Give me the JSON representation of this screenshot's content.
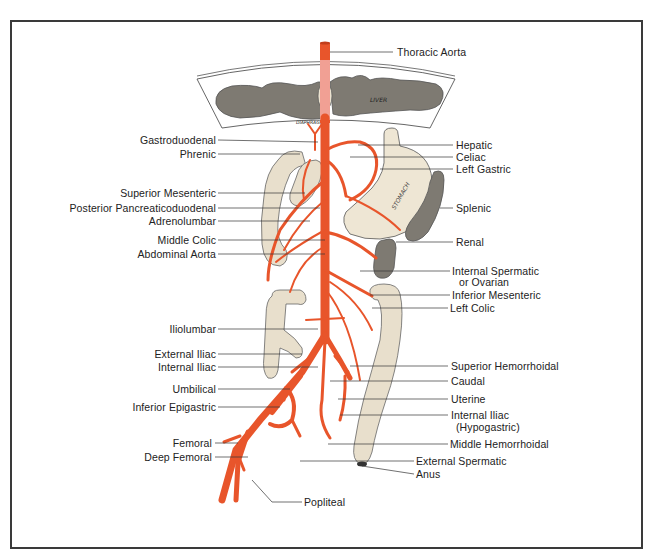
{
  "figure": {
    "colors": {
      "artery": "#e8552b",
      "artery_dark": "#c23e1c",
      "thoracic_aorta_behind": "#f2a8a0",
      "organ_gray": "#7e7a72",
      "intestine": "#e8dfcc",
      "stomach": "#eee6d4",
      "frame": "#3a3a3a",
      "leader_line": "#333333"
    },
    "organ_labels": {
      "liver": "LIVER",
      "diaphragm": "DIAPHRAGM",
      "stomach": "STOMACH",
      "spleen": "SPLEEN",
      "kidney": "KIDNEY"
    }
  },
  "labels": {
    "left": [
      {
        "id": "gastroduodenal",
        "text": "Gastroduodenal"
      },
      {
        "id": "phrenic",
        "text": "Phrenic"
      },
      {
        "id": "superior-mesenteric",
        "text": "Superior Mesenteric"
      },
      {
        "id": "posterior-pancreaticoduodenal",
        "text": "Posterior Pancreaticoduodenal"
      },
      {
        "id": "adrenolumbar",
        "text": "Adrenolumbar"
      },
      {
        "id": "middle-colic",
        "text": "Middle Colic"
      },
      {
        "id": "abdominal-aorta",
        "text": "Abdominal Aorta"
      },
      {
        "id": "iliolumbar",
        "text": "Iliolumbar"
      },
      {
        "id": "external-iliac",
        "text": "External Iliac"
      },
      {
        "id": "internal-iliac-left",
        "text": "Internal Iliac"
      },
      {
        "id": "umbilical",
        "text": "Umbilical"
      },
      {
        "id": "inferior-epigastric",
        "text": "Inferior Epigastric"
      },
      {
        "id": "femoral",
        "text": "Femoral"
      },
      {
        "id": "deep-femoral",
        "text": "Deep Femoral"
      }
    ],
    "right": [
      {
        "id": "thoracic-aorta",
        "text": "Thoracic Aorta"
      },
      {
        "id": "hepatic",
        "text": "Hepatic"
      },
      {
        "id": "celiac",
        "text": "Celiac"
      },
      {
        "id": "left-gastric",
        "text": "Left Gastric"
      },
      {
        "id": "splenic",
        "text": "Splenic"
      },
      {
        "id": "renal",
        "text": "Renal"
      },
      {
        "id": "internal-spermatic",
        "text": "Internal Spermatic"
      },
      {
        "id": "or-ovarian",
        "text": "or Ovarian"
      },
      {
        "id": "inferior-mesenteric",
        "text": "Inferior Mesenteric"
      },
      {
        "id": "left-colic",
        "text": "Left Colic"
      },
      {
        "id": "superior-hemorrhoidal",
        "text": "Superior Hemorrhoidal"
      },
      {
        "id": "caudal",
        "text": "Caudal"
      },
      {
        "id": "uterine",
        "text": "Uterine"
      },
      {
        "id": "internal-iliac-right",
        "text": "Internal Iliac"
      },
      {
        "id": "hypogastric",
        "text": "(Hypogastric)"
      },
      {
        "id": "middle-hemorrhoidal",
        "text": "Middle Hemorrhoidal"
      },
      {
        "id": "external-spermatic",
        "text": "External Spermatic"
      },
      {
        "id": "anus",
        "text": "Anus"
      },
      {
        "id": "popliteal",
        "text": "Popliteal"
      }
    ]
  }
}
